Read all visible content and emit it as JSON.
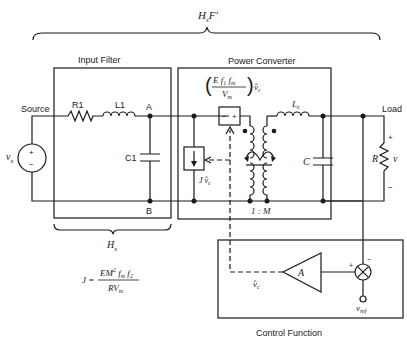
{
  "diagram": {
    "top_brace_label": "H",
    "top_brace_label_sub": "s",
    "top_brace_label_suffix": "F′",
    "blocks": {
      "input_filter": {
        "title": "Input Filter",
        "brace_label": "H",
        "brace_label_sub": "s"
      },
      "power_converter": {
        "title": "Power Converter"
      },
      "control_function": {
        "title": "Control Function",
        "amp_label": "A"
      }
    },
    "labels": {
      "source": "Source",
      "load": "Load",
      "vs": "v",
      "vs_sub": "s",
      "r1": "R1",
      "l1": "L1",
      "c1": "C1",
      "node_a": "A",
      "node_b": "B",
      "le": "L",
      "le_sub": "e",
      "c": "C",
      "r": "R",
      "v": "v",
      "plus": "+",
      "minus": "−",
      "ratio": "1 : M",
      "j_vc": "J v̂",
      "j_vc_sub": "c",
      "vc_hat": "v̂",
      "vc_sub": "c",
      "vref": "v",
      "vref_sub": "ref",
      "gen_numer": "E f",
      "gen_numer_sub1": "1",
      "gen_numer_f": " f",
      "gen_numer_sub2": "m",
      "gen_denom": "V",
      "gen_denom_sub": "m",
      "gen_vc": "v̂",
      "gen_vc_sub": "c",
      "src_box_minus": "−",
      "src_box_plus": "+"
    },
    "equation": {
      "lhs": "J =",
      "numer": "EM",
      "numer_sup": "2",
      "numer_rest": " f",
      "numer_sub1": "m",
      "numer_f2": " f",
      "numer_sub2": "2",
      "denom": "RV",
      "denom_sub": "m"
    }
  }
}
